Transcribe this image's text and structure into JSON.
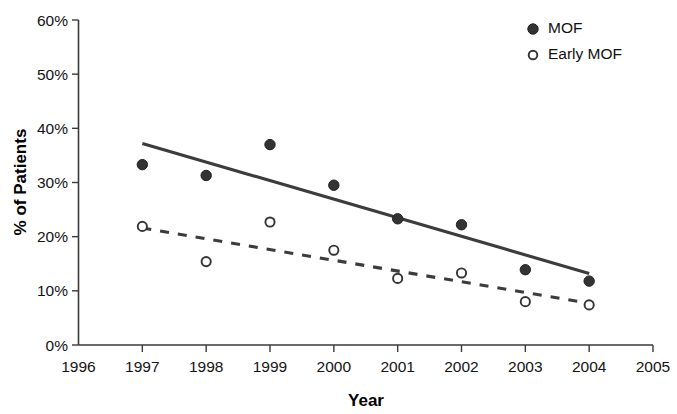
{
  "chart_data": {
    "type": "scatter",
    "title": "",
    "xlabel": "Year",
    "ylabel": "% of Patients",
    "xlim": [
      1996,
      2005
    ],
    "ylim": [
      0,
      60
    ],
    "grid": false,
    "legend_position": "top-right",
    "x_tick_labels": [
      "1996",
      "1997",
      "1998",
      "1999",
      "2000",
      "2001",
      "2002",
      "2003",
      "2004",
      "2005"
    ],
    "y_tick_labels": [
      "0%",
      "10%",
      "20%",
      "30%",
      "40%",
      "50%",
      "60%"
    ],
    "y_ticks": [
      0,
      10,
      20,
      30,
      40,
      50,
      60
    ],
    "x": [
      1997,
      1998,
      1999,
      2000,
      2001,
      2002,
      2003,
      2004
    ],
    "series": [
      {
        "name": "MOF",
        "marker": "filled-circle",
        "values": [
          33.3,
          31.3,
          37.0,
          29.5,
          23.3,
          22.2,
          13.9,
          11.8
        ],
        "trendline": {
          "style": "solid",
          "x_start": 1997,
          "y_start": 37.2,
          "x_end": 2004,
          "y_end": 13.2
        }
      },
      {
        "name": "Early MOF",
        "marker": "open-circle",
        "values": [
          21.9,
          15.4,
          22.7,
          17.5,
          12.3,
          13.3,
          8.0,
          7.4
        ],
        "trendline": {
          "style": "dashed",
          "x_start": 1997,
          "y_start": 21.6,
          "x_end": 2004,
          "y_end": 7.7
        }
      }
    ]
  },
  "legend": {
    "items": [
      {
        "label": "MOF",
        "marker": "filled-circle"
      },
      {
        "label": "Early MOF",
        "marker": "open-circle"
      }
    ]
  },
  "axes": {
    "y_title": "% of Patients",
    "x_title": "Year"
  }
}
